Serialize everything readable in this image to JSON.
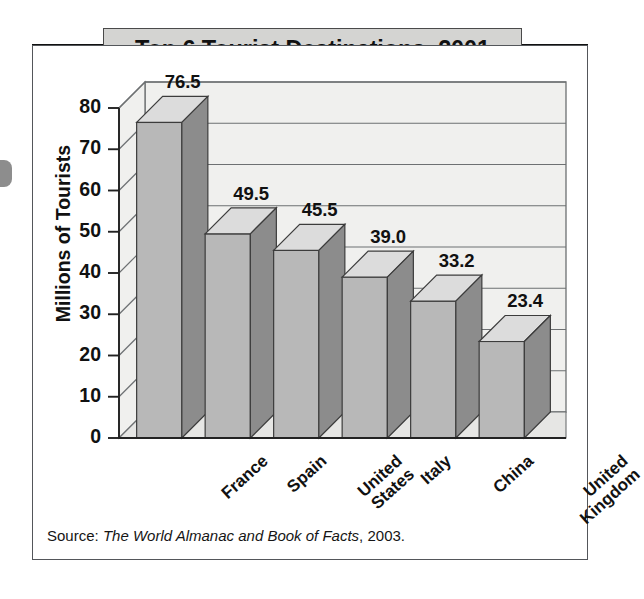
{
  "figure": {
    "title": "Top 6 Tourist Destinations, 2001",
    "source_prefix": "Source: ",
    "source_italic": "The World Almanac and Book of Facts",
    "source_suffix": ", 2003."
  },
  "colors": {
    "title_box_fill": "#d4d4d2",
    "title_rule": "#111111",
    "frame_border": "#53565a",
    "plot_wall": "#f0f0ee",
    "plot_floor": "#e6e6e4",
    "gridline": "#6d7072",
    "bar_front": "#b8b8b8",
    "bar_top": "#dcdcdc",
    "bar_side": "#8c8c8c",
    "bar_outline": "#3c3c3c",
    "axis": "#222222",
    "text": "#111111",
    "scan_blob": "#8d8d8d"
  },
  "chart_data": {
    "type": "bar",
    "title": "Top 6 Tourist Destinations, 2001",
    "subtitle": "",
    "xlabel": "",
    "ylabel": "Millions of Tourists",
    "categories": [
      "France",
      "Spain",
      "United States",
      "Italy",
      "China",
      "United Kingdom"
    ],
    "category_lines": [
      [
        "France"
      ],
      [
        "Spain"
      ],
      [
        "United",
        "States"
      ],
      [
        "Italy"
      ],
      [
        "China"
      ],
      [
        "United",
        "Kingdom"
      ]
    ],
    "values": [
      76.5,
      49.5,
      45.5,
      39.0,
      33.2,
      23.4
    ],
    "value_labels": [
      "76.5",
      "49.5",
      "45.5",
      "39.0",
      "33.2",
      "23.4"
    ],
    "ylim": [
      0,
      80
    ],
    "ytick_values": [
      0,
      10,
      20,
      30,
      40,
      50,
      60,
      70,
      80
    ],
    "ytick_labels": [
      "0",
      "10",
      "20",
      "30",
      "40",
      "50",
      "60",
      "70",
      "80"
    ],
    "grid": true,
    "grid_orientation": "horizontal",
    "legend": false,
    "legend_position": "none",
    "three_d": true,
    "units": "millions of tourists"
  }
}
